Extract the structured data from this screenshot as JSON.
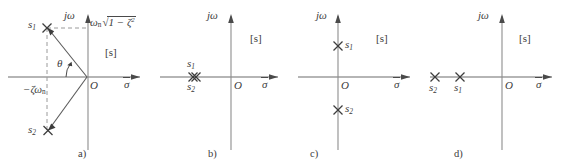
{
  "figure": {
    "type": "s-plane-pole-location-diagrams",
    "panel_count": 4
  },
  "common": {
    "imag_axis_label": "jω",
    "real_axis_label": "σ",
    "plane_label": "[s]",
    "origin_label": "O",
    "pole_marker": "x-marker-icon"
  },
  "panels": [
    {
      "caption": "a)",
      "case": "underdamped-complex-conjugate-poles",
      "plane_label": "[s]",
      "imag_axis_label": "jω",
      "real_axis_label": "σ",
      "origin_label": "O",
      "angle_label": "θ",
      "real_part_label": "−ζω",
      "real_part_sub": "n",
      "imag_part_label": "ω",
      "imag_part_sub": "n",
      "radical_sign": "√",
      "radical_body": "1 − ζ",
      "radical_exponent": "2",
      "poles": [
        {
          "label": "s",
          "sub": "1",
          "x": -0.62,
          "y": 0.82
        },
        {
          "label": "s",
          "sub": "2",
          "x": -0.62,
          "y": -0.82
        }
      ]
    },
    {
      "caption": "b)",
      "case": "critically-damped-double-real-pole",
      "plane_label": "[s]",
      "imag_axis_label": "jω",
      "real_axis_label": "σ",
      "origin_label": "O",
      "poles": [
        {
          "label": "s",
          "sub": "1",
          "x": -0.62,
          "y": 0
        },
        {
          "label": "s",
          "sub": "2",
          "x": -0.62,
          "y": 0
        }
      ]
    },
    {
      "caption": "c)",
      "case": "undamped-poles-on-imaginary-axis",
      "plane_label": "[s]",
      "imag_axis_label": "jω",
      "real_axis_label": "σ",
      "origin_label": "O",
      "poles": [
        {
          "label": "s",
          "sub": "1",
          "x": 0,
          "y": 0.52
        },
        {
          "label": "s",
          "sub": "2",
          "x": 0,
          "y": -0.52
        }
      ]
    },
    {
      "caption": "d)",
      "case": "overdamped-two-distinct-real-poles",
      "plane_label": "[s]",
      "imag_axis_label": "jω",
      "real_axis_label": "σ",
      "origin_label": "O",
      "poles": [
        {
          "label": "s",
          "sub": "1",
          "x": -0.33,
          "y": 0
        },
        {
          "label": "s",
          "sub": "2",
          "x": -0.68,
          "y": 0
        }
      ]
    }
  ]
}
